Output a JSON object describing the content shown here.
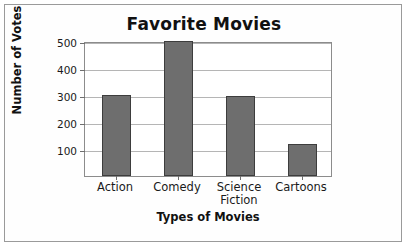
{
  "chart_data": {
    "type": "bar",
    "title": "Favorite Movies",
    "xlabel": "Types of Movies",
    "ylabel": "Number of Votes",
    "categories": [
      "Action",
      "Comedy",
      "Science Fiction",
      "Cartoons"
    ],
    "values": [
      300,
      500,
      295,
      120
    ],
    "ylim": [
      0,
      500
    ],
    "yticks": [
      100,
      200,
      300,
      400,
      500
    ],
    "ytick_labels": [
      "100",
      "200",
      "300",
      "400",
      "500"
    ],
    "grid": true,
    "legend": null,
    "bar_color": "#6e6e6e",
    "bar_edge_color": "#3d3d3d",
    "plot_background": "#ffffff",
    "frame_color": "#9a9a9a"
  }
}
